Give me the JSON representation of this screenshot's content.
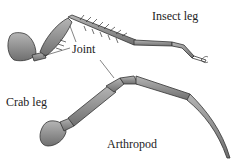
{
  "figure": {
    "labels": {
      "insect_leg": "Insect leg",
      "joint": "Joint",
      "crab_leg": "Crab leg",
      "arthropod": "Arthropod"
    },
    "colors": {
      "leg_fill": "#8a8a8a",
      "leg_stroke": "#333333",
      "background": "#ffffff"
    }
  }
}
